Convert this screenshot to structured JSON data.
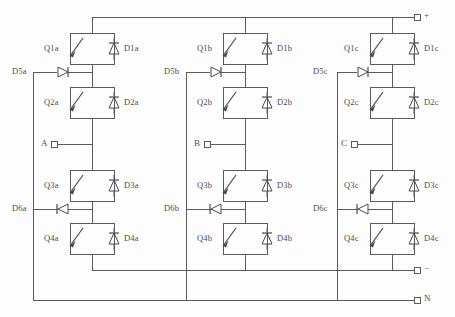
{
  "diagram": {
    "type": "power-electronics-schematic",
    "line_color": "#5a5a5a",
    "background_color": "#fdfdfd",
    "phases": [
      {
        "id": "a",
        "ac_terminal_label": "A",
        "switches": [
          "Q1a",
          "Q2a",
          "Q3a",
          "Q4a"
        ],
        "antiparallel_diodes": [
          "D1a",
          "D2a",
          "D3a",
          "D4a"
        ],
        "clamping_diodes": [
          "D5a",
          "D6a"
        ]
      },
      {
        "id": "b",
        "ac_terminal_label": "B",
        "switches": [
          "Q1b",
          "Q2b",
          "Q3b",
          "Q4b"
        ],
        "antiparallel_diodes": [
          "D1b",
          "D2b",
          "D3b",
          "D4b"
        ],
        "clamping_diodes": [
          "D5b",
          "D6b"
        ]
      },
      {
        "id": "c",
        "ac_terminal_label": "C",
        "switches": [
          "Q1c",
          "Q2c",
          "Q3c",
          "Q4c"
        ],
        "antiparallel_diodes": [
          "D1c",
          "D2c",
          "D3c",
          "D4c"
        ],
        "clamping_diodes": [
          "D5c",
          "D6c"
        ]
      }
    ],
    "dc_terminals": [
      {
        "name": "dc-positive",
        "label": "+"
      },
      {
        "name": "dc-negative",
        "label": "−"
      },
      {
        "name": "dc-neutral",
        "label": "N"
      }
    ]
  }
}
